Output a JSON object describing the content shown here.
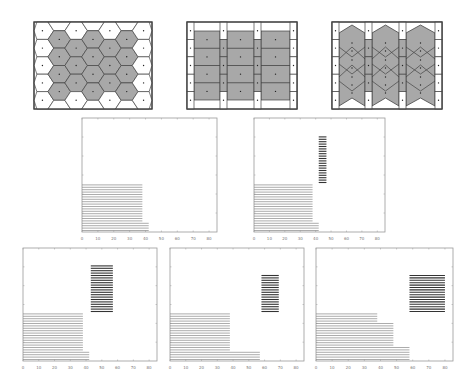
{
  "figure": {
    "voronoi_panels": [
      {
        "id": "hexagonal",
        "grid_cols": 7,
        "grid_rows": 5,
        "shaded": "interior cells",
        "shape": "hexagon"
      },
      {
        "id": "rectangular",
        "grid_cols": 3,
        "grid_rows": 4,
        "shaded": "interior blocks",
        "shape": "rectangle"
      },
      {
        "id": "chevron",
        "grid_cols": 3,
        "grid_rows": 4,
        "shaded": "interior blocks",
        "shape": "chevron/diamond"
      }
    ],
    "colors": {
      "shade": "#a8a8a8",
      "edge": "#444444",
      "bar": "#888888",
      "bar_dark": "#333333",
      "axis": "#999999"
    },
    "x_ticks": [
      "0",
      "10",
      "20",
      "30",
      "40",
      "50",
      "60",
      "70",
      "80"
    ]
  },
  "chart_data": [
    {
      "type": "bar",
      "orientation": "horizontal-gantt",
      "xlim": [
        0,
        85
      ],
      "x_ticks": [
        0,
        10,
        20,
        30,
        40,
        50,
        60,
        70,
        80
      ],
      "groups": [
        {
          "start": 0,
          "end": 38,
          "rows": 16,
          "row_start": 4
        },
        {
          "start": 0,
          "end": 42,
          "rows": 4,
          "row_start": 0
        }
      ]
    },
    {
      "type": "bar",
      "orientation": "horizontal-gantt",
      "xlim": [
        0,
        85
      ],
      "x_ticks": [
        0,
        10,
        20,
        30,
        40,
        50,
        60,
        70,
        80
      ],
      "groups": [
        {
          "start": 0,
          "end": 38,
          "rows": 16,
          "row_start": 4
        },
        {
          "start": 0,
          "end": 42,
          "rows": 4,
          "row_start": 0
        },
        {
          "start": 42,
          "end": 47,
          "rows": 20,
          "row_start": 20,
          "dark": true
        }
      ]
    },
    {
      "type": "bar",
      "orientation": "horizontal-gantt",
      "xlim": [
        0,
        85
      ],
      "x_ticks": [
        0,
        10,
        20,
        30,
        40,
        50,
        60,
        70,
        80
      ],
      "groups": [
        {
          "start": 0,
          "end": 38,
          "rows": 16,
          "row_start": 4
        },
        {
          "start": 0,
          "end": 42,
          "rows": 4,
          "row_start": 0
        },
        {
          "start": 43,
          "end": 57,
          "rows": 20,
          "row_start": 20,
          "dark": true
        }
      ]
    },
    {
      "type": "bar",
      "orientation": "horizontal-gantt",
      "xlim": [
        0,
        85
      ],
      "x_ticks": [
        0,
        10,
        20,
        30,
        40,
        50,
        60,
        70,
        80
      ],
      "groups": [
        {
          "start": 0,
          "end": 38,
          "rows": 16,
          "row_start": 4
        },
        {
          "start": 0,
          "end": 57,
          "rows": 4,
          "row_start": 0
        },
        {
          "start": 58,
          "end": 69,
          "rows": 16,
          "row_start": 20,
          "dark": true
        }
      ]
    },
    {
      "type": "bar",
      "orientation": "horizontal-gantt",
      "xlim": [
        0,
        85
      ],
      "x_ticks": [
        0,
        10,
        20,
        30,
        40,
        50,
        60,
        70,
        80
      ],
      "groups": [
        {
          "start": 0,
          "end": 38,
          "rows": 4,
          "row_start": 16
        },
        {
          "start": 0,
          "end": 48,
          "rows": 10,
          "row_start": 6
        },
        {
          "start": 0,
          "end": 58,
          "rows": 6,
          "row_start": 0
        },
        {
          "start": 58,
          "end": 80,
          "rows": 16,
          "row_start": 20,
          "dark": true
        }
      ]
    }
  ]
}
